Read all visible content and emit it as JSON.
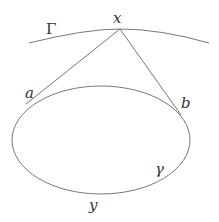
{
  "diagram": {
    "labels": {
      "Gamma": "Γ",
      "x": "x",
      "a": "a",
      "b": "b",
      "gamma": "γ",
      "y": "y"
    },
    "colors": {
      "stroke": "#777777",
      "text": "#333333",
      "background": "#ffffff"
    }
  }
}
